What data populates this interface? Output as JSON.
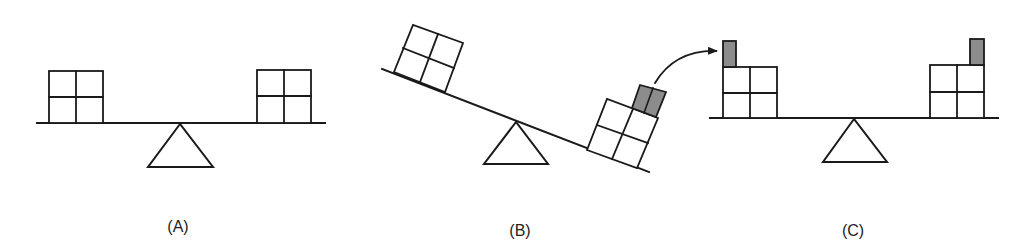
{
  "figure": {
    "colors": {
      "line": "#1a1a1a",
      "block_fill": "#ffffff",
      "added_piece_fill": "#8c8c8c"
    },
    "panels": [
      {
        "id": "A",
        "label": "(A)",
        "state": "balanced",
        "left_stack": "2x2 blocks",
        "right_stack": "2x2 blocks"
      },
      {
        "id": "B",
        "label": "(B)",
        "state": "tilted right-down",
        "left_stack": "2x2 blocks",
        "right_stack": "2x2 blocks plus gray piece split in two halves",
        "arrow": "curved arrow moving one gray half to panel C"
      },
      {
        "id": "C",
        "label": "(C)",
        "state": "balanced",
        "left_stack": "2x2 blocks plus one gray half",
        "right_stack": "2x2 blocks plus one gray half"
      }
    ]
  }
}
